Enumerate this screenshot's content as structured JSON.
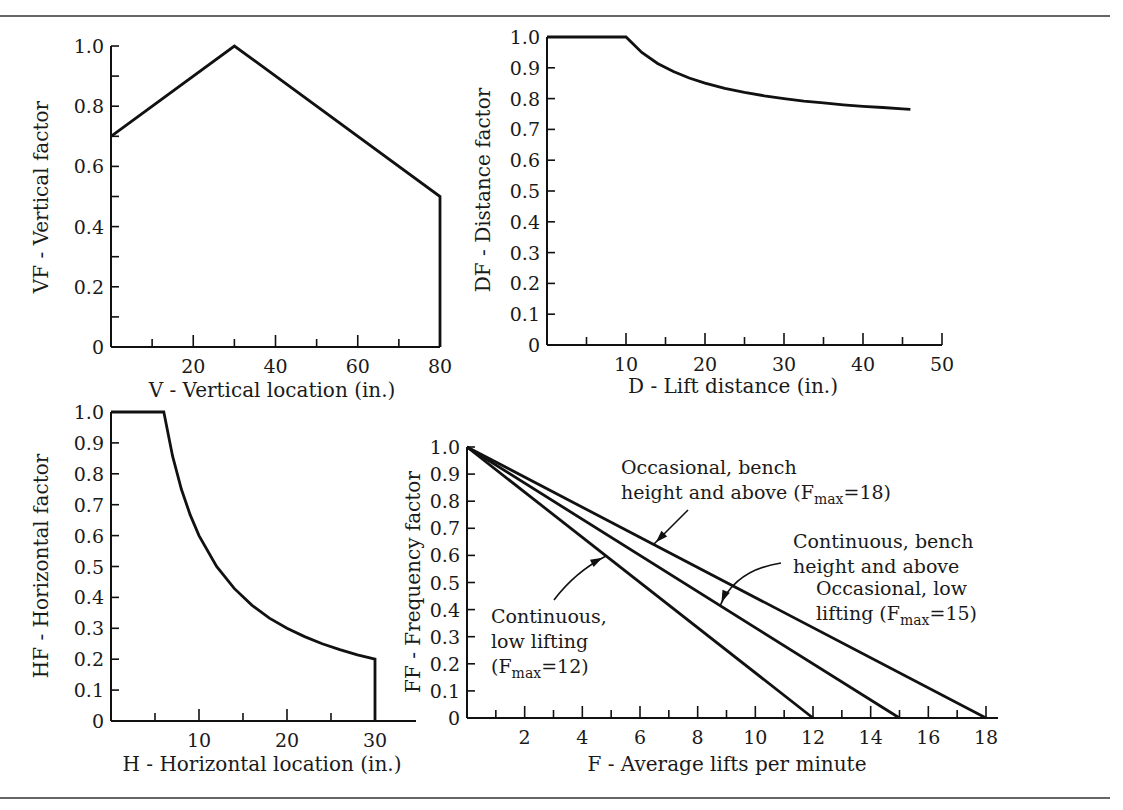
{
  "figure": {
    "rules": {
      "top_y": 16,
      "bottom_y": 798,
      "x1": 0,
      "x2": 1110
    }
  },
  "chart_data": [
    {
      "id": "vf",
      "type": "line",
      "title": "",
      "xlabel": "V - Vertical location (in.)",
      "ylabel": "VF - Vertical factor",
      "xlim": [
        0,
        80
      ],
      "ylim": [
        0,
        1.0
      ],
      "x_tick_labels": [
        "20",
        "40",
        "60",
        "80"
      ],
      "x_tick_values": [
        20,
        40,
        60,
        80
      ],
      "x_minor_ticks": [
        10,
        20,
        30,
        40,
        50,
        60,
        70
      ],
      "y_tick_labels": [
        "0",
        "0.2",
        "0.4",
        "0.6",
        "0.8",
        "1.0"
      ],
      "y_tick_values": [
        0,
        0.2,
        0.4,
        0.6,
        0.8,
        1.0
      ],
      "y_minor_ticks": [
        0.1,
        0.3,
        0.5,
        0.7,
        0.9
      ],
      "grid": false,
      "series": [
        {
          "name": "VF",
          "x": [
            0,
            30,
            80,
            80
          ],
          "y": [
            0.7,
            1.0,
            0.5,
            0
          ]
        }
      ],
      "frame": {
        "x0": 111,
        "x1": 440,
        "y0": 347,
        "y1": 46,
        "axis_end_x": 440
      }
    },
    {
      "id": "df",
      "type": "line",
      "title": "",
      "xlabel": "D - Lift distance (in.)",
      "ylabel": "DF - Distance factor",
      "xlim": [
        0,
        50
      ],
      "ylim": [
        0,
        1.0
      ],
      "x_tick_labels": [
        "10",
        "20",
        "30",
        "40",
        "50"
      ],
      "x_tick_values": [
        10,
        20,
        30,
        40,
        50
      ],
      "x_minor_ticks": [
        5,
        10,
        15,
        20,
        25,
        30,
        35,
        40,
        45,
        50
      ],
      "y_tick_labels": [
        "0",
        "0.1",
        "0.2",
        "0.3",
        "0.4",
        "0.5",
        "0.6",
        "0.7",
        "0.8",
        "0.9",
        "1.0"
      ],
      "y_tick_values": [
        0,
        0.1,
        0.2,
        0.3,
        0.4,
        0.5,
        0.6,
        0.7,
        0.8,
        0.9,
        1.0
      ],
      "y_minor_ticks": [],
      "grid": false,
      "series": [
        {
          "name": "DF",
          "x": [
            0,
            10,
            12,
            14,
            16,
            18,
            20,
            22.5,
            25,
            27.5,
            30,
            32.5,
            35,
            37.5,
            40,
            42.5,
            45,
            46
          ],
          "y": [
            1.0,
            1.0,
            0.95,
            0.914,
            0.888,
            0.867,
            0.85,
            0.833,
            0.82,
            0.809,
            0.8,
            0.792,
            0.786,
            0.78,
            0.775,
            0.771,
            0.767,
            0.765
          ]
        }
      ],
      "frame": {
        "x0": 547,
        "x1": 942,
        "y0": 345,
        "y1": 37,
        "axis_end_x": 942
      }
    },
    {
      "id": "hf",
      "type": "line",
      "title": "",
      "xlabel": "H - Horizontal location (in.)",
      "ylabel": "HF - Horizontal factor",
      "xlim": [
        0,
        30
      ],
      "ylim": [
        0,
        1.0
      ],
      "x_tick_labels": [
        "10",
        "20",
        "30"
      ],
      "x_tick_values": [
        10,
        20,
        30
      ],
      "x_minor_ticks": [
        5,
        10,
        15,
        20,
        25
      ],
      "y_tick_labels": [
        "0",
        "0.1",
        "0.2",
        "0.3",
        "0.4",
        "0.5",
        "0.6",
        "0.7",
        "0.8",
        "0.9",
        "1.0"
      ],
      "y_tick_values": [
        0,
        0.1,
        0.2,
        0.3,
        0.4,
        0.5,
        0.6,
        0.7,
        0.8,
        0.9,
        1.0
      ],
      "y_minor_ticks": [],
      "grid": false,
      "series": [
        {
          "name": "HF",
          "x": [
            0,
            6,
            7,
            8,
            9,
            10,
            12,
            14,
            16,
            18,
            20,
            22,
            24,
            26,
            28,
            30,
            30
          ],
          "y": [
            1.0,
            1.0,
            0.857,
            0.75,
            0.667,
            0.6,
            0.5,
            0.429,
            0.375,
            0.333,
            0.3,
            0.273,
            0.25,
            0.231,
            0.214,
            0.2,
            0
          ]
        }
      ],
      "frame": {
        "x0": 111,
        "x1": 375,
        "y0": 721,
        "y1": 412,
        "axis_end_x": 416
      }
    },
    {
      "id": "ff",
      "type": "line",
      "title": "",
      "xlabel": "F - Average lifts per minute",
      "ylabel": "FF - Frequency factor",
      "xlim": [
        0,
        18
      ],
      "ylim": [
        0,
        1.0
      ],
      "x_tick_labels": [
        "2",
        "4",
        "6",
        "8",
        "10",
        "12",
        "14",
        "16",
        "18"
      ],
      "x_tick_values": [
        2,
        4,
        6,
        8,
        10,
        12,
        14,
        16,
        18
      ],
      "x_minor_ticks": [
        1,
        2,
        3,
        4,
        5,
        6,
        7,
        8,
        9,
        10,
        11,
        12,
        13,
        14,
        15,
        16,
        17,
        18
      ],
      "y_tick_labels": [
        "0",
        "0.1",
        "0.2",
        "0.3",
        "0.4",
        "0.5",
        "0.6",
        "0.7",
        "0.8",
        "0.9",
        "1.0"
      ],
      "y_tick_values": [
        0,
        0.1,
        0.2,
        0.3,
        0.4,
        0.5,
        0.6,
        0.7,
        0.8,
        0.9,
        1.0
      ],
      "y_minor_ticks": [],
      "grid": false,
      "series": [
        {
          "name": "Continuous, low lifting (Fmax=12)",
          "x": [
            0,
            12
          ],
          "y": [
            1.0,
            0
          ]
        },
        {
          "name": "Continuous, bench height and above / Occasional, low lifting (Fmax=15)",
          "x": [
            0,
            15
          ],
          "y": [
            1.0,
            0
          ]
        },
        {
          "name": "Occasional, bench height and above (Fmax=18)",
          "x": [
            0,
            18
          ],
          "y": [
            1.0,
            0
          ]
        }
      ],
      "annotations": [
        {
          "lines": [
            "Occasional, bench",
            "height and above (F|max|=18)"
          ],
          "x": 621,
          "y": 474,
          "arrow": {
            "from": [
              688,
              510
            ],
            "ctrl": [
              670,
              528
            ],
            "to": [
              653,
              545
            ]
          }
        },
        {
          "lines": [
            "Continuous, bench",
            "height and above"
          ],
          "x": 793,
          "y": 548,
          "arrow": {
            "from": [
              781,
              563
            ],
            "ctrl": [
              735,
              570
            ],
            "to": [
              720,
              606
            ]
          }
        },
        {
          "lines": [
            "Occasional, low",
            "lifting (F|max|=15)"
          ],
          "x": 816,
          "y": 595,
          "arrow": null
        },
        {
          "lines": [
            "Continuous,",
            "low lifting",
            "(F|max|=12)"
          ],
          "x": 491,
          "y": 623,
          "arrow": {
            "from": [
              554,
              600
            ],
            "ctrl": [
              575,
              572
            ],
            "to": [
              606,
              556
            ]
          }
        }
      ],
      "frame": {
        "x0": 467,
        "x1": 986,
        "y0": 718,
        "y1": 447,
        "axis_end_x": 998
      }
    }
  ],
  "axis_title_positions": {
    "vf": {
      "x_title": [
        272,
        397
      ],
      "y_title": [
        48,
        197
      ]
    },
    "df": {
      "x_title": [
        733,
        393
      ],
      "y_title": [
        490,
        190
      ]
    },
    "hf": {
      "x_title": [
        262,
        771
      ],
      "y_title": [
        48,
        566
      ]
    },
    "ff": {
      "x_title": [
        727,
        771
      ],
      "y_title": [
        420,
        582
      ]
    }
  }
}
